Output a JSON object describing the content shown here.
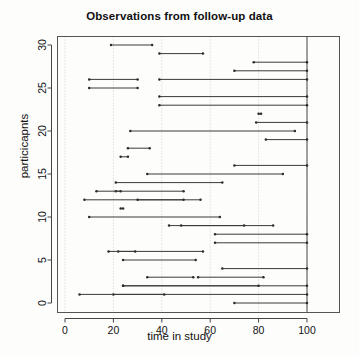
{
  "chart_data": {
    "type": "line",
    "title": "Observations from follow-up data",
    "xlabel": "time in study",
    "ylabel": "particicapnts",
    "xlim": [
      0,
      115
    ],
    "ylim": [
      0,
      31
    ],
    "xticks": [
      0,
      20,
      40,
      60,
      80,
      100
    ],
    "yticks": [
      0,
      5,
      10,
      15,
      20,
      25,
      30
    ],
    "grid": "dotted vertical gridlines at x ticks",
    "legend": "none",
    "annotations": [
      {
        "type": "vline",
        "x": 100,
        "label": "study end reference line"
      }
    ],
    "series_description": "Horizontal follow-up interval per participant: entry time to exit time, one segment per participant id.",
    "segments": [
      {
        "id": 30,
        "start": 19,
        "stop": 36
      },
      {
        "id": 29,
        "start": 39,
        "stop": 57
      },
      {
        "id": 28,
        "start": 78,
        "stop": 100
      },
      {
        "id": 27,
        "start": 70,
        "stop": 100
      },
      {
        "id": 26,
        "start": 39,
        "stop": 100
      },
      {
        "id": 25,
        "start": 10,
        "stop": 30
      },
      {
        "id": 24,
        "start": 39,
        "stop": 100
      },
      {
        "id": 23,
        "start": 39,
        "stop": 100
      },
      {
        "id": 22,
        "start": 80,
        "stop": 81
      },
      {
        "id": 21,
        "start": 79,
        "stop": 100
      },
      {
        "id": 20,
        "start": 27,
        "stop": 95
      },
      {
        "id": 19,
        "start": 83,
        "stop": 100
      },
      {
        "id": 18,
        "start": 26,
        "stop": 35
      },
      {
        "id": 17,
        "start": 23,
        "stop": 26
      },
      {
        "id": 16,
        "start": 70,
        "stop": 100
      },
      {
        "id": 15,
        "start": 34,
        "stop": 90
      },
      {
        "id": 14,
        "start": 21,
        "stop": 65
      },
      {
        "id": 13,
        "start": 21,
        "stop": 23
      },
      {
        "id": 12,
        "start": 8,
        "stop": 56
      },
      {
        "id": 11,
        "start": 23,
        "stop": 24
      },
      {
        "id": 10,
        "start": 10,
        "stop": 64
      },
      {
        "id": 9,
        "start": 43,
        "stop": 86
      },
      {
        "id": 8,
        "start": 62,
        "stop": 100
      },
      {
        "id": 7,
        "start": 62,
        "stop": 100
      },
      {
        "id": 6,
        "start": 22,
        "stop": 57
      },
      {
        "id": 5,
        "start": 24,
        "stop": 54
      },
      {
        "id": 4,
        "start": 65,
        "stop": 100
      },
      {
        "id": 3,
        "start": 55,
        "stop": 82
      },
      {
        "id": 2,
        "start": 24,
        "stop": 100
      },
      {
        "id": 1,
        "start": 20,
        "stop": 100
      },
      {
        "id": 0,
        "start": 70,
        "stop": 100
      }
    ],
    "extra_segments": [
      {
        "id": 26,
        "start": 10,
        "stop": 30
      },
      {
        "id": 13,
        "start": 13,
        "stop": 49
      },
      {
        "id": 12,
        "start": 30,
        "stop": 49
      },
      {
        "id": 9,
        "start": 48,
        "stop": 74
      },
      {
        "id": 6,
        "start": 18,
        "stop": 29
      },
      {
        "id": 3,
        "start": 34,
        "stop": 53
      },
      {
        "id": 2,
        "start": 24,
        "stop": 80
      },
      {
        "id": 1,
        "start": 6,
        "stop": 41
      }
    ]
  },
  "axes": {
    "x_tick_labels": [
      "0",
      "20",
      "40",
      "60",
      "80",
      "100"
    ],
    "y_tick_labels": [
      "0",
      "5",
      "10",
      "15",
      "20",
      "25",
      "30"
    ]
  }
}
